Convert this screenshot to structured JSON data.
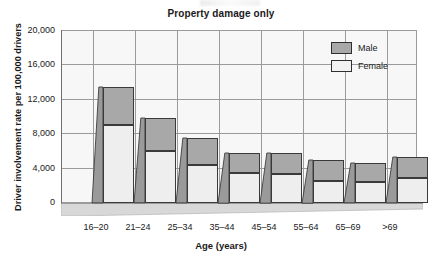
{
  "chart_data": {
    "type": "bar",
    "subtype": "stacked-3d-column",
    "title": "Property damage only",
    "xlabel": "Age (years)",
    "ylabel": "Driver involvement rate per 100,000 drivers",
    "categories": [
      "16–20",
      "21–24",
      "25–34",
      "35–44",
      "45–54",
      "55–64",
      "65–69",
      ">69"
    ],
    "series": [
      {
        "name": "Female",
        "color": "#eeeeee",
        "values": [
          9000,
          6000,
          4400,
          3500,
          3300,
          2550,
          2450,
          2900
        ]
      },
      {
        "name": "Male",
        "color": "#a8a8a8",
        "values": [
          4400,
          3800,
          3100,
          2300,
          2500,
          2450,
          2150,
          2400
        ]
      }
    ],
    "totals": [
      13400,
      9800,
      7500,
      5800,
      5800,
      5000,
      4600,
      5300
    ],
    "ylim": [
      0,
      20000
    ],
    "yticks": [
      0,
      4000,
      8000,
      12000,
      16000,
      20000
    ],
    "ytick_labels": [
      "0",
      "4,000",
      "8,000",
      "12,000",
      "16,000",
      "20,000"
    ],
    "grid": "both",
    "legend_position": "top-right",
    "legend_entries": [
      "Male",
      "Female"
    ]
  },
  "legend": {
    "male": "Male",
    "female": "Female"
  }
}
